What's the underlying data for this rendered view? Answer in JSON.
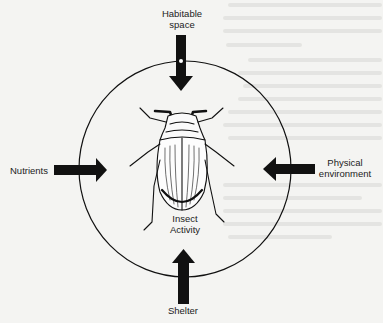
{
  "diagram": {
    "title": "",
    "center": {
      "icon": "beetle-icon",
      "label_line1": "Insect",
      "label_line2": "Activity"
    },
    "inputs": [
      {
        "position": "top",
        "label_line1": "Habitable",
        "label_line2": "space",
        "icon": "arrow-down-icon"
      },
      {
        "position": "left",
        "label_line1": "Nutrients",
        "label_line2": "",
        "icon": "arrow-right-icon"
      },
      {
        "position": "right",
        "label_line1": "Physical",
        "label_line2": "environment",
        "icon": "arrow-left-icon"
      },
      {
        "position": "bottom",
        "label_line1": "Shelter",
        "label_line2": "",
        "icon": "arrow-up-icon"
      }
    ],
    "colors": {
      "background": "#f4f4f2",
      "ink": "#111111",
      "text": "#222222"
    }
  }
}
